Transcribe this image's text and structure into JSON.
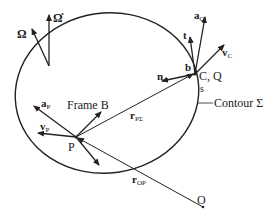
{
  "diagram": {
    "contour_label": "Contour Σ",
    "frame_label": "Frame B",
    "points": {
      "P": "P",
      "CQ": "C, Q",
      "O": "O",
      "s": "s"
    },
    "vectors": {
      "omega": "Ω",
      "omega_dot": "Ω̇",
      "a_P": {
        "main": "a",
        "sub": "P"
      },
      "v_P": {
        "main": "v",
        "sub": "P"
      },
      "a_Q": {
        "main": "a",
        "sub": "Q"
      },
      "v_C": {
        "main": "v",
        "sub": "C"
      },
      "t": "t",
      "n": "n",
      "b": "b",
      "r_PSigma": {
        "main": "r",
        "sub": "PΣ"
      },
      "r_OP": {
        "main": "r",
        "sub": "OP"
      }
    },
    "colors": {
      "stroke": "#222222",
      "background": "#ffffff"
    }
  }
}
